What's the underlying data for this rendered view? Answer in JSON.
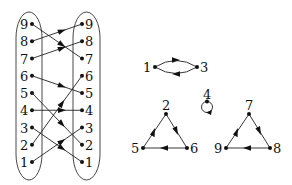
{
  "diagram": {
    "bipartite": {
      "left_nodes": [
        "9",
        "8",
        "7",
        "6",
        "5",
        "4",
        "3",
        "2",
        "1"
      ],
      "right_nodes": [
        "9",
        "8",
        "7",
        "6",
        "5",
        "4",
        "3",
        "2",
        "1"
      ],
      "mapping": [
        {
          "from": "1",
          "to": "3"
        },
        {
          "from": "2",
          "to": "6"
        },
        {
          "from": "3",
          "to": "1"
        },
        {
          "from": "4",
          "to": "4"
        },
        {
          "from": "5",
          "to": "2"
        },
        {
          "from": "6",
          "to": "5"
        },
        {
          "from": "7",
          "to": "8"
        },
        {
          "from": "8",
          "to": "9"
        },
        {
          "from": "9",
          "to": "7"
        }
      ]
    },
    "cycles": [
      {
        "nodes": [
          "1",
          "3"
        ],
        "edges": [
          [
            "1",
            "3"
          ],
          [
            "3",
            "1"
          ]
        ]
      },
      {
        "nodes": [
          "4"
        ],
        "edges": [
          [
            "4",
            "4"
          ]
        ]
      },
      {
        "nodes": [
          "2",
          "6",
          "5"
        ],
        "edges": [
          [
            "2",
            "6"
          ],
          [
            "6",
            "5"
          ],
          [
            "5",
            "2"
          ]
        ]
      },
      {
        "nodes": [
          "7",
          "8",
          "9"
        ],
        "edges": [
          [
            "7",
            "8"
          ],
          [
            "8",
            "9"
          ],
          [
            "9",
            "7"
          ]
        ]
      }
    ],
    "labels": {
      "c13_a": "1",
      "c13_b": "3",
      "c4": "4",
      "t1_top": "2",
      "t1_left": "5",
      "t1_right": "6",
      "t2_top": "7",
      "t2_left": "9",
      "t2_right": "8"
    }
  }
}
